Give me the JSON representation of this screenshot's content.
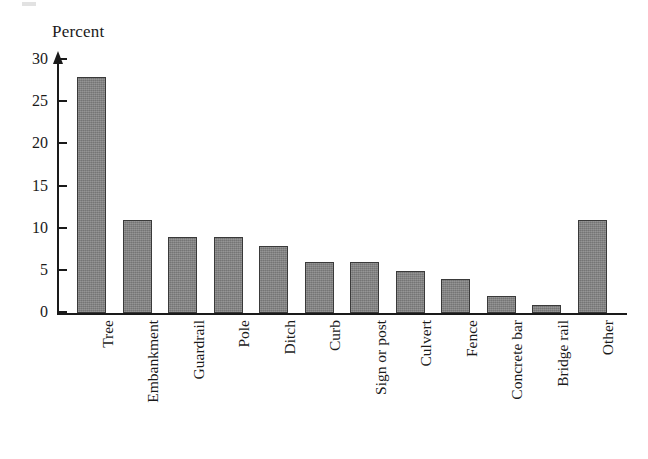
{
  "chart_data": {
    "type": "bar",
    "title": "",
    "subtitle": "",
    "xlabel": "",
    "ylabel": "Percent",
    "ylim": [
      0,
      30
    ],
    "yticks": [
      0,
      5,
      10,
      15,
      20,
      25,
      30
    ],
    "grid": false,
    "legend": null,
    "axis_style": "arrow-tipped y-axis, plain baseline x-axis",
    "bar_fill_color": "#808080",
    "bar_border_color": "#3a3a3a",
    "categories": [
      "Tree",
      "Embankment",
      "Guardrail",
      "Pole",
      "Ditch",
      "Curb",
      "Sign or post",
      "Culvert",
      "Fence",
      "Concrete bar",
      "Bridge rail",
      "Other"
    ],
    "values": [
      28,
      11,
      9,
      9,
      8,
      6,
      6,
      5,
      4,
      2,
      1,
      11
    ]
  }
}
